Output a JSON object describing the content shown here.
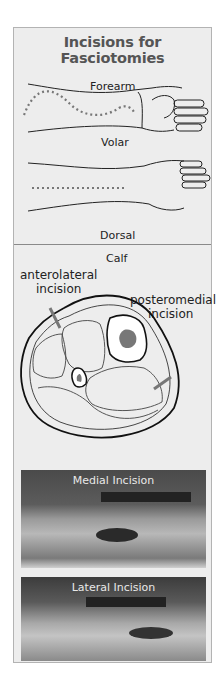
{
  "title": "Incisions for Fasciotomies",
  "forearm": {
    "heading": "Forearm",
    "volar_label": "Volar",
    "dorsal_label": "Dorsal"
  },
  "calf": {
    "heading": "Calf",
    "anterolateral_label_line1": "anterolateral",
    "anterolateral_label_line2": "incision",
    "posteromedial_label_line1": "posteromedial",
    "posteromedial_label_line2": "incision"
  },
  "photos": [
    {
      "caption": "Medial Incision"
    },
    {
      "caption": "Lateral Incision"
    }
  ],
  "colors": {
    "panel_bg": "#ededed",
    "border": "#b3b3b3",
    "title": "#555555",
    "incision_line": "#777777",
    "bone_fill": "#777777"
  }
}
